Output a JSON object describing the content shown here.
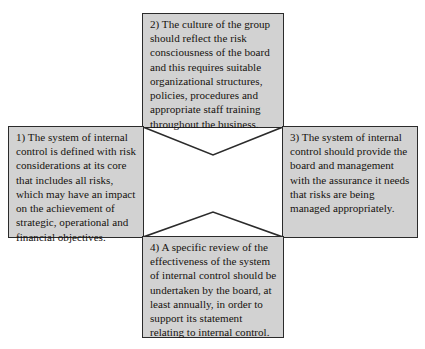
{
  "diagram": {
    "type": "four-pointed-star-quadrant-diagram",
    "colors": {
      "box_fill": "#d2d2d2",
      "box_border": "#2b2b2b",
      "star_fill": "#ffffff",
      "star_border": "#2b2b2b",
      "page_background": "#ffffff",
      "text": "#16120f"
    },
    "center_shape": {
      "name": "four-pointed-star",
      "fill": "#ffffff",
      "stroke": "#2b2b2b"
    },
    "boxes": [
      {
        "id": "box-left",
        "position": "left",
        "number": "1)",
        "text": "1) The system of internal control is defined with risk considerations at its core that includes all risks, which may have an impact on the achievement of strategic, operational and financial objectives."
      },
      {
        "id": "box-top",
        "position": "top",
        "number": "2)",
        "text": "2) The culture of the group should reflect the risk consciousness of the board and this requires suitable organizational structures, policies, procedures and appropriate staff training throughout the business."
      },
      {
        "id": "box-right",
        "position": "right",
        "number": "3)",
        "text": "3) The system of internal control should provide the board and management with the assurance it needs that risks are being managed appropriately."
      },
      {
        "id": "box-bottom",
        "position": "bottom",
        "number": "4)",
        "text": "4) A specific review of the effectiveness of the system of internal control should be undertaken by the board, at least annually, in order to support its statement relating to internal control."
      }
    ]
  }
}
